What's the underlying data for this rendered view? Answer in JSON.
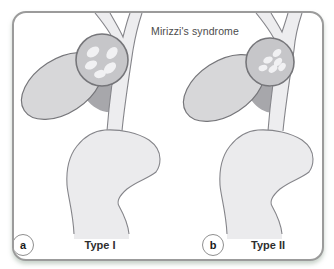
{
  "figure": {
    "title": "Mirizzi's syndrome",
    "panels": [
      {
        "marker": "a",
        "label": "Type I"
      },
      {
        "marker": "b",
        "label": "Type II"
      }
    ],
    "colors": {
      "frame_border": "#9b9b9b",
      "duct_fill": "#ededef",
      "outline": "#85858a",
      "gallbladder_fill": "#d7d7d9",
      "gallbladder_neck_fill": "#a7a7ab",
      "stone_pouch_fill": "#c6c6c9",
      "gallstone_fill": "#f1f1f3",
      "title_color": "#4c4c4c",
      "label_color": "#2e2e2e"
    }
  }
}
